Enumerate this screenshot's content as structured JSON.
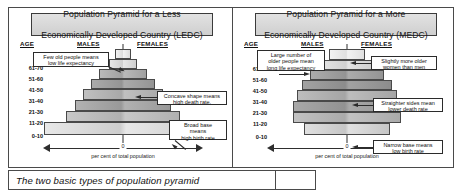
{
  "caption": "The two basic types of  population pyramid",
  "axis": {
    "zero_label": "0",
    "scale_caption": "per cent of total population"
  },
  "headers": {
    "age": "AGE",
    "males": "MALES",
    "females": "FEMALES"
  },
  "age_groups": [
    "70+",
    "61-70",
    "51-60",
    "41-50",
    "31-40",
    "21-30",
    "11-20",
    "0-10"
  ],
  "panels": [
    {
      "id": "ledc",
      "title_line1": "Population Pyramid for a Less",
      "title_line2": "Economically Developed Country (LEDC)",
      "callouts": [
        {
          "name": "life-expectancy-callout",
          "line1": "Few old people means",
          "line2": "low life expectancy"
        },
        {
          "name": "death-rate-callout",
          "line1": "Concave shape means",
          "line2": "high death rate."
        },
        {
          "name": "birth-rate-callout",
          "line1": "Broad base",
          "line2": "means",
          "line3": "high birth rate"
        }
      ]
    },
    {
      "id": "medc",
      "title_line1": "Population Pyramid for a More",
      "title_line2": "Economically Developed Country (MEDC)",
      "callouts": [
        {
          "name": "life-expectancy-callout",
          "line1": "Large number of",
          "line2": "older people mean",
          "line3": "long life expectancy"
        },
        {
          "name": "older-women-callout",
          "line1": "Slightly more older",
          "line2": "women than men"
        },
        {
          "name": "death-rate-callout",
          "line1": "Straighter sides mean",
          "line2": "lower death rate"
        },
        {
          "name": "birth-rate-callout",
          "line1": "Narrow base means",
          "line2": "low birth rate"
        }
      ]
    }
  ],
  "chart_data": [
    {
      "type": "bar",
      "id": "ledc-population-pyramid",
      "title": "Population Pyramid for a Less Economically Developed Country (LEDC)",
      "xlabel": "per cent of total population",
      "ylabel": "AGE",
      "categories": [
        "70+",
        "61-70",
        "51-60",
        "41-50",
        "31-40",
        "21-30",
        "11-20",
        "0-10"
      ],
      "series": [
        {
          "name": "MALES",
          "values": [
            1.5,
            3.0,
            7.0,
            12.0,
            16.5,
            21.0,
            27.5,
            44.0
          ]
        },
        {
          "name": "FEMALES",
          "values": [
            1.5,
            3.0,
            7.0,
            12.0,
            16.5,
            21.0,
            27.5,
            44.0
          ]
        }
      ],
      "shape_note": "concave sides, very broad base",
      "legend": "none",
      "grid": false
    },
    {
      "type": "bar",
      "id": "medc-population-pyramid",
      "title": "Population Pyramid for a More Economically Developed Country (MEDC)",
      "xlabel": "per cent of total population",
      "ylabel": "AGE",
      "categories": [
        "70+",
        "61-70",
        "51-60",
        "41-50",
        "31-40",
        "21-30",
        "11-20",
        "0-10"
      ],
      "series": [
        {
          "name": "MALES",
          "values": [
            9.0,
            14.0,
            20.0,
            25.0,
            28.0,
            30.0,
            30.0,
            24.0
          ]
        },
        {
          "name": "FEMALES",
          "values": [
            11.0,
            14.0,
            20.0,
            25.0,
            28.0,
            30.0,
            30.0,
            24.0
          ]
        }
      ],
      "shape_note": "straighter sides, narrow base",
      "legend": "none",
      "grid": false
    }
  ],
  "bar_styles": {
    "ledc": [
      {
        "w": 16,
        "h": 10,
        "top": 0,
        "fill1": "#f2f2f2",
        "fill2": "#dcdcdc"
      },
      {
        "w": 28,
        "h": 10,
        "top": 10,
        "fill1": "#e6e6e6",
        "fill2": "#cfcfcf"
      },
      {
        "w": 48,
        "h": 10,
        "top": 20,
        "fill1": "#b9b9b9",
        "fill2": "#a0a0a0"
      },
      {
        "w": 64,
        "h": 10,
        "top": 30,
        "fill1": "#ababab",
        "fill2": "#949494"
      },
      {
        "w": 80,
        "h": 11,
        "top": 40,
        "fill1": "#c0c0c0",
        "fill2": "#a8a8a8"
      },
      {
        "w": 96,
        "h": 11,
        "top": 51,
        "fill1": "#b2b2b2",
        "fill2": "#999999"
      },
      {
        "w": 114,
        "h": 11,
        "top": 62,
        "fill1": "#c8c8c8",
        "fill2": "#b0b0b0"
      },
      {
        "w": 158,
        "h": 13,
        "top": 73,
        "fill1": "#e8e8e8",
        "fill2": "#cdcdcd"
      }
    ],
    "medc": [
      {
        "w": 36,
        "h": 11,
        "top": 0,
        "fill1": "#f2f2f2",
        "fill2": "#e0e0e0"
      },
      {
        "w": 52,
        "h": 10,
        "top": 11,
        "fill1": "#e4e4e4",
        "fill2": "#d0d0d0"
      },
      {
        "w": 74,
        "h": 10,
        "top": 21,
        "fill1": "#acacac",
        "fill2": "#949494"
      },
      {
        "w": 90,
        "h": 10,
        "top": 31,
        "fill1": "#a2a2a2",
        "fill2": "#8c8c8c"
      },
      {
        "w": 100,
        "h": 11,
        "top": 41,
        "fill1": "#bdbdbd",
        "fill2": "#a5a5a5"
      },
      {
        "w": 108,
        "h": 11,
        "top": 52,
        "fill1": "#a8a8a8",
        "fill2": "#929292"
      },
      {
        "w": 108,
        "h": 11,
        "top": 63,
        "fill1": "#c2c2c2",
        "fill2": "#aaaaaa"
      },
      {
        "w": 86,
        "h": 12,
        "top": 74,
        "fill1": "#e0e0e0",
        "fill2": "#c6c6c6"
      }
    ]
  }
}
